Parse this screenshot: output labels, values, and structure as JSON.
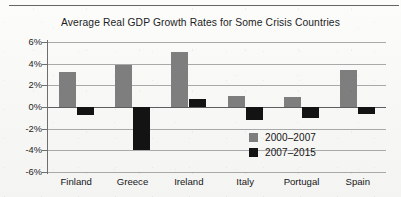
{
  "figure": {
    "title": "Average Real GDP Growth Rates for Some Crisis Countries"
  },
  "chart_data": {
    "type": "bar",
    "title": "Average Real GDP Growth Rates for Some Crisis Countries",
    "xlabel": "",
    "ylabel": "",
    "ylim": [
      -6,
      6
    ],
    "ytick_labels": [
      "6%",
      "4%",
      "2%",
      "0%",
      "-2%",
      "-4%",
      "-6%"
    ],
    "ytick_values": [
      6,
      4,
      2,
      0,
      -2,
      -4,
      -6
    ],
    "grid": true,
    "legend_position": "inside-lower-right",
    "categories": [
      "Finland",
      "Greece",
      "Ireland",
      "Italy",
      "Portugal",
      "Spain"
    ],
    "series": [
      {
        "name": "2000–2007",
        "color": "#7e7e7e",
        "values": [
          3.2,
          3.9,
          5.1,
          1.0,
          0.9,
          3.4
        ]
      },
      {
        "name": "2007–2015",
        "color": "#131313",
        "values": [
          -0.7,
          -4.0,
          0.7,
          -1.2,
          -1.0,
          -0.6
        ]
      }
    ]
  }
}
